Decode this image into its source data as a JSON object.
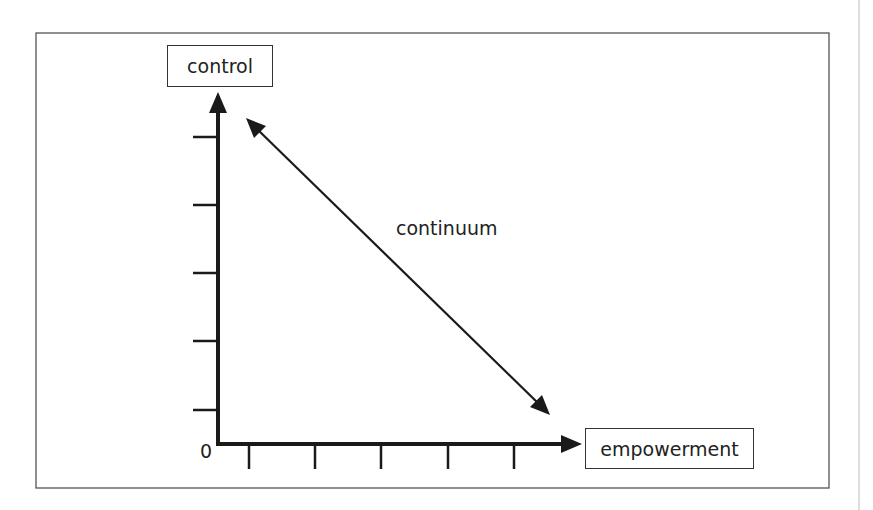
{
  "diagram": {
    "y_axis_label": "control",
    "x_axis_label": "empowerment",
    "origin_label": "0",
    "arrow_label": "continuum",
    "y_ticks": 5,
    "x_ticks": 5
  },
  "colors": {
    "line": "#1a1a1a",
    "frame": "#555555",
    "text": "#222222"
  }
}
